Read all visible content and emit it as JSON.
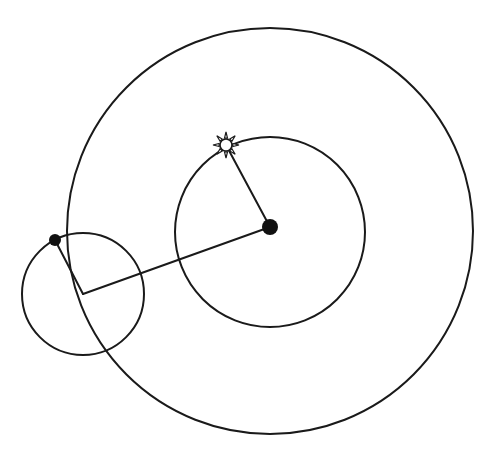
{
  "diagram": {
    "title": "",
    "colors": {
      "stroke": "#1a1a1a",
      "fill_dot": "#111111",
      "background": "#ffffff"
    },
    "circles": [
      {
        "id": "deferent-outer",
        "cx": 270,
        "cy": 231,
        "r": 203
      },
      {
        "id": "inner-circle",
        "cx": 270,
        "cy": 232,
        "r": 95
      },
      {
        "id": "epicycle",
        "cx": 83,
        "cy": 294,
        "r": 61
      }
    ],
    "points": [
      {
        "id": "central-body",
        "x": 270,
        "y": 227,
        "r": 8,
        "style": "filled"
      },
      {
        "id": "planet",
        "x": 55,
        "y": 240,
        "r": 6,
        "style": "filled"
      },
      {
        "id": "sun",
        "x": 226,
        "y": 145,
        "r": 6,
        "rays": 8,
        "ray_length": 13,
        "style": "sun-symbol"
      }
    ],
    "lines": [
      {
        "id": "central-to-sun",
        "x1": 270,
        "y1": 227,
        "x2": 226,
        "y2": 145
      },
      {
        "id": "central-to-epicycle-center",
        "x1": 270,
        "y1": 227,
        "x2": 83,
        "y2": 294
      },
      {
        "id": "planet-to-epicycle-center",
        "x1": 55,
        "y1": 240,
        "x2": 83,
        "y2": 294
      }
    ],
    "labels": []
  }
}
